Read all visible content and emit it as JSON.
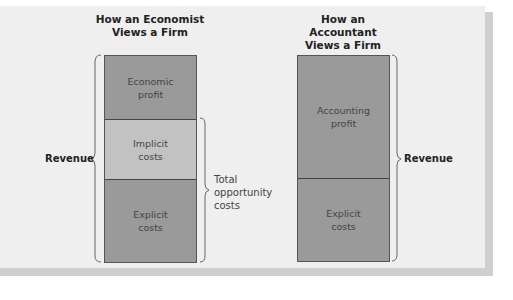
{
  "left_panel": {
    "title": "How an Economist\nViews a Firm",
    "segments": [
      {
        "label": "Economic\nprofit",
        "shade": "dark"
      },
      {
        "label": "Implicit\ncosts",
        "shade": "light"
      },
      {
        "label": "Explicit\ncosts",
        "shade": "dark"
      }
    ],
    "revenue_label": "Revenue",
    "opportunity_label": "Total\nopportunity\ncosts"
  },
  "right_panel": {
    "title": "How an Accountant\nViews a Firm",
    "segments": [
      {
        "label": "Accounting\nprofit",
        "shade": "dark"
      },
      {
        "label": "Explicit\ncosts",
        "shade": "dark"
      }
    ],
    "revenue_label": "Revenue"
  },
  "colors": {
    "panel_bg": "#efefef",
    "dark_segment": "#9a9a9a",
    "light_segment": "#c2c2c2",
    "shadow": "#cfcfcf"
  }
}
